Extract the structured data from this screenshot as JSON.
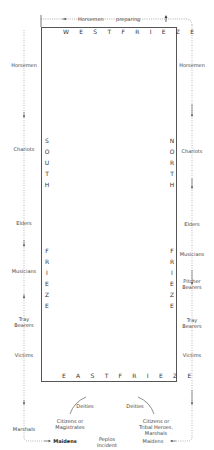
{
  "diagram": {
    "friezes": {
      "west": "W E S T   F R I E Z E",
      "east": "E A S T   F R I E Z E",
      "south": "S\nO\nU\nT\nH\n\n\n\n\n\nF\nR\nI\nE\nZ\nE",
      "north": "N\nO\nR\nT\nH\n\n\n\n\n\nF\nR\nI\nE\nZ\nE"
    },
    "top": {
      "horsemen": "Horsemen",
      "preparing": "preparing"
    },
    "south_side": {
      "horsemen": "Horsemen",
      "chariots": "Chariots",
      "elders": "Elders",
      "musicians": "Musicians",
      "tray_bearers_1": "Tray",
      "tray_bearers_2": "Bearers",
      "victims": "Victims",
      "marshals": "Marshals",
      "maidens": "Maidens"
    },
    "north_side": {
      "horsemen": "Horsemen",
      "chariots": "Chariots",
      "elders": "Elders",
      "musicians": "Musicians",
      "pitcher_bearers_1": "Pitcher",
      "pitcher_bearers_2": "Bearers",
      "tray_bearers_1": "Tray",
      "tray_bearers_2": "Bearers",
      "victims": "Victims",
      "maidens": "Maidens"
    },
    "east_center": {
      "deities_left": "Deities",
      "deities_right": "Deities",
      "citizens_left_1": "Citizens or",
      "citizens_left_2": "Magistrates",
      "citizens_right_1": "Citizens or",
      "citizens_right_2": "Tribal Heroes,",
      "citizens_right_3": "Marshals",
      "peplos_1": "Peplos",
      "peplos_2": "Incident"
    }
  }
}
